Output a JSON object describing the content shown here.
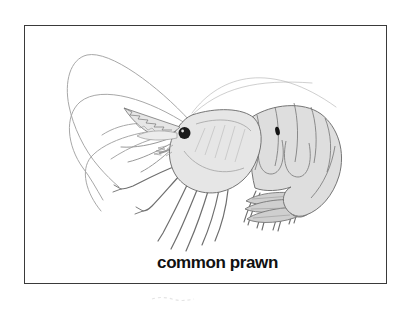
{
  "card": {
    "caption": "common prawn"
  },
  "colors": {
    "background": "#ffffff",
    "border": "#3a3a3a",
    "caption_text": "#111111",
    "outline": "#757575",
    "body_fill": "#e6e6e6",
    "abdomen_fill": "#dedede",
    "tail_fill": "#cfcfcf",
    "scale_fill": "#ececec",
    "detail": "#999999",
    "hatch": "#b3b3b3",
    "antenna": "#a8a8a8",
    "leg": "#6e6e6e",
    "eye": "#1b1b1b",
    "spot": "#141414",
    "artifact": "#d8d8d8"
  }
}
